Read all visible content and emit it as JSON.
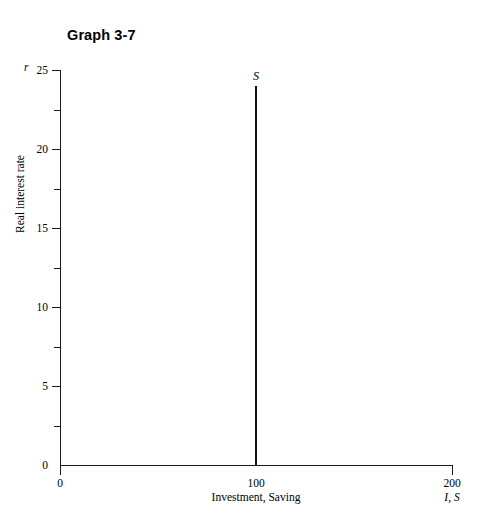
{
  "title": "Graph 3-7",
  "chart_data": {
    "type": "line",
    "title": "Graph 3-7",
    "xlabel": "Investment, Saving",
    "xsymbol": "I, S",
    "ylabel": "Real interest rate",
    "ysymbol": "r",
    "xlim": [
      0,
      200
    ],
    "ylim": [
      0,
      25
    ],
    "grid": false,
    "legend": "none",
    "x_ticks": [
      {
        "value": 0,
        "label": "0"
      },
      {
        "value": 100,
        "label": "100"
      },
      {
        "value": 200,
        "label": "200"
      }
    ],
    "y_ticks": [
      {
        "value": 25,
        "label": "25",
        "major": true
      },
      {
        "value": 22.5,
        "label": "",
        "major": false
      },
      {
        "value": 20,
        "label": "20",
        "major": true
      },
      {
        "value": 17.5,
        "label": "",
        "major": false
      },
      {
        "value": 15,
        "label": "15",
        "major": true
      },
      {
        "value": 12.5,
        "label": "",
        "major": false
      },
      {
        "value": 10,
        "label": "10",
        "major": true
      },
      {
        "value": 7.5,
        "label": "",
        "major": false
      },
      {
        "value": 5,
        "label": "5",
        "major": true
      },
      {
        "value": 2.5,
        "label": "",
        "major": false
      },
      {
        "value": 0,
        "label": "0",
        "major": false
      }
    ],
    "series": [
      {
        "name": "S",
        "label": "S",
        "description": "Vertical saving schedule at quantity 100",
        "color": "#111111",
        "x": [
          100,
          100
        ],
        "y": [
          0,
          24
        ]
      }
    ],
    "annotations": [
      {
        "text": "S",
        "x": 100,
        "y": 25
      }
    ]
  }
}
